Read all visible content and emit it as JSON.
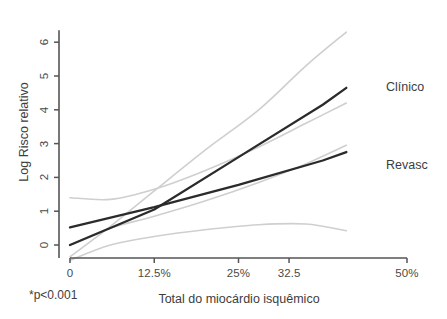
{
  "chart_data": {
    "type": "line",
    "title": "",
    "xlabel": "Total do miocárdio isquêmico",
    "ylabel": "Log Risco relativo",
    "xlim": [
      0,
      50
    ],
    "ylim": [
      -0.6,
      6.6
    ],
    "grid": false,
    "legend_position": "right-inline",
    "x_tick_values": [
      0,
      12.5,
      25,
      32.5,
      50
    ],
    "x_tick_labels": [
      "0",
      "12.5%",
      "25%",
      "32.5",
      "50%"
    ],
    "y_tick_values": [
      0,
      1,
      2,
      3,
      4,
      5,
      6
    ],
    "y_tick_labels": [
      "0",
      "1",
      "2",
      "3",
      "4",
      "5",
      "6"
    ],
    "annotations": [
      "*p<0.001"
    ],
    "series": [
      {
        "name": "Clínico",
        "color": "#2b2b2b",
        "x": [
          0,
          12.5,
          25,
          37.5,
          41
        ],
        "values": [
          0.0,
          1.05,
          2.6,
          4.15,
          4.65
        ],
        "ci_upper": {
          "x": [
            0,
            6,
            12.5,
            20,
            28,
            35,
            41
          ],
          "values": [
            -0.35,
            0.55,
            1.6,
            2.8,
            4.0,
            5.3,
            6.3
          ]
        },
        "ci_lower": {
          "x": [
            0,
            6,
            12.5,
            20,
            28,
            35,
            41
          ],
          "values": [
            1.4,
            1.35,
            1.65,
            2.2,
            2.9,
            3.6,
            4.2
          ]
        }
      },
      {
        "name": "Revasc",
        "color": "#2b2b2b",
        "x": [
          0,
          12.5,
          25,
          37.5,
          41
        ],
        "values": [
          0.52,
          1.12,
          1.78,
          2.5,
          2.75
        ],
        "ci_upper": {
          "x": [
            0,
            6,
            12.5,
            20,
            28,
            35,
            41
          ],
          "values": [
            0.0,
            0.5,
            0.85,
            1.3,
            1.85,
            2.4,
            2.95
          ]
        },
        "ci_lower": {
          "x": [
            0,
            6,
            12.5,
            20,
            28,
            35,
            41
          ],
          "values": [
            -0.45,
            0.0,
            0.25,
            0.45,
            0.6,
            0.62,
            0.42
          ]
        }
      }
    ]
  },
  "axis": {
    "y_title": "Log Risco relativo",
    "x_title": "Total do miocárdio isquêmico",
    "x_ticks": [
      "0",
      "12.5%",
      "25%",
      "32.5",
      "50%"
    ],
    "y_ticks": [
      "0",
      "1",
      "2",
      "3",
      "4",
      "5",
      "6"
    ]
  },
  "labels": {
    "clinico": "Clínico",
    "revasc": "Revasc",
    "footnote": "*p<0.001"
  },
  "colors": {
    "line": "#2b2b2b",
    "ci_band": "#c9c9c9",
    "axis": "#555555",
    "text": "#3d3d3d"
  }
}
